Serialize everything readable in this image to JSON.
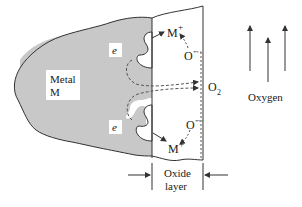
{
  "diagram": {
    "labels": {
      "metal_line1": "Metal",
      "metal_line2": "M",
      "electron_top": "e",
      "electron_bottom": "e",
      "ion_top": "M",
      "ion_top_charge": "+",
      "ion_bottom": "M",
      "ion_bottom_charge": "+",
      "oxygen_ion_top": "O",
      "oxygen_ion_top_charge": "−",
      "oxygen_ion_bottom": "O",
      "oxygen_ion_bottom_charge": "−",
      "o2": "O",
      "o2_subscript": "2",
      "oxygen": "Oxygen",
      "oxide_line1": "Oxide",
      "oxide_line2": "layer"
    },
    "colors": {
      "metal_fill": "#c8c8c8",
      "outline": "#333333",
      "background": "#ffffff"
    }
  }
}
